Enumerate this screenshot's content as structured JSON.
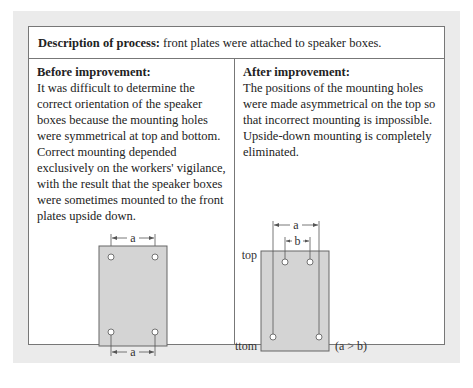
{
  "header": {
    "label": "Description of process:",
    "text": " front plates were attached to speaker boxes."
  },
  "before": {
    "title": "Before improvement:",
    "text": "It was difficult to determine the correct orientation of the speaker boxes because the mounting holes were symmetrical at top and bottom. Correct mounting depended exclusively on the workers' vigilance, with the result that the speaker boxes were sometimes mounted to the front plates upside down.",
    "diagram": {
      "top_dim": "a",
      "bottom_dim": "a"
    }
  },
  "after": {
    "title": "After improvement:",
    "text": "The positions of the mounting holes were made asymmetrical on the top so that incorrect mounting is impossible. Upside-down mounting is completely eliminated.",
    "diagram": {
      "outer_dim": "a",
      "inner_dim": "b",
      "top_label": "top",
      "bottom_label": "bottom",
      "condition": "(a > b)"
    }
  },
  "colors": {
    "plate_fill": "#d4d4d4",
    "plate_stroke": "#666666",
    "border": "#777777",
    "panel_bg": "#ebebeb"
  }
}
